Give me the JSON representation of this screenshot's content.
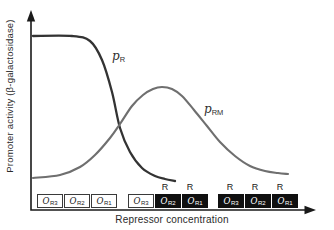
{
  "figure": {
    "y_axis_label": "Promoter activity (β-galactosidase)",
    "x_axis_label": "Repressor concentration"
  },
  "colors": {
    "axis": "#1a1a1a",
    "pr_curve": "#333333",
    "prm_curve": "#6f6f6f",
    "filled_box": "#101010",
    "filled_box_text": "#ffffff",
    "empty_box_border": "#3a3a3a",
    "text": "#2a2a2a"
  },
  "curve_labels": [
    {
      "id": "pr",
      "main": "p",
      "sub": "R",
      "x": 112,
      "y": 50
    },
    {
      "id": "prm",
      "main": "p",
      "sub": "RM",
      "x": 204,
      "y": 103
    }
  ],
  "curves": [
    {
      "name": "pR",
      "color": "#333333",
      "width": 2.3,
      "points": [
        [
          33,
          36
        ],
        [
          72,
          36
        ],
        [
          90,
          41
        ],
        [
          102,
          60
        ],
        [
          112,
          92
        ],
        [
          120,
          128
        ],
        [
          130,
          152
        ],
        [
          142,
          168
        ],
        [
          155,
          176
        ],
        [
          165,
          179
        ],
        [
          175,
          181
        ]
      ]
    },
    {
      "name": "pRM",
      "color": "#6f6f6f",
      "width": 2.1,
      "points": [
        [
          33,
          178
        ],
        [
          60,
          175
        ],
        [
          80,
          167
        ],
        [
          95,
          155
        ],
        [
          110,
          138
        ],
        [
          120,
          124
        ],
        [
          132,
          106
        ],
        [
          143,
          95
        ],
        [
          153,
          89
        ],
        [
          162,
          87
        ],
        [
          172,
          89
        ],
        [
          182,
          96
        ],
        [
          194,
          110
        ],
        [
          207,
          126
        ],
        [
          220,
          142
        ],
        [
          235,
          156
        ],
        [
          250,
          166
        ],
        [
          265,
          171
        ],
        [
          278,
          173
        ],
        [
          288,
          174
        ]
      ]
    }
  ],
  "repressor_label": "R",
  "operator_groups": [
    {
      "x": 37,
      "boxes": [
        {
          "main": "O",
          "sub": "R3",
          "filled": false,
          "repressor": false
        },
        {
          "main": "O",
          "sub": "R2",
          "filled": false,
          "repressor": false
        },
        {
          "main": "O",
          "sub": "R1",
          "filled": false,
          "repressor": false
        }
      ]
    },
    {
      "x": 128,
      "boxes": [
        {
          "main": "O",
          "sub": "R3",
          "filled": false,
          "repressor": false
        },
        {
          "main": "O",
          "sub": "R2",
          "filled": true,
          "repressor": true
        },
        {
          "main": "O",
          "sub": "R1",
          "filled": true,
          "repressor": true
        }
      ]
    },
    {
      "x": 218,
      "boxes": [
        {
          "main": "O",
          "sub": "R3",
          "filled": true,
          "repressor": true
        },
        {
          "main": "O",
          "sub": "R2",
          "filled": true,
          "repressor": true
        },
        {
          "main": "O",
          "sub": "R1",
          "filled": true,
          "repressor": true
        }
      ]
    }
  ],
  "chart_data": {
    "type": "line",
    "title": "",
    "xlabel": "Repressor concentration",
    "ylabel": "Promoter activity (β-galactosidase)",
    "xlim": [
      0,
      1
    ],
    "ylim": [
      0,
      1
    ],
    "grid": false,
    "legend_position": "inline-curve-labels",
    "axes_note": "Both axes are qualitative (no numeric ticks); values below are normalized 0-1 estimates read from the drawing.",
    "series": [
      {
        "name": "pR",
        "x": [
          0.01,
          0.15,
          0.21,
          0.26,
          0.29,
          0.32,
          0.36,
          0.4,
          0.45,
          0.48,
          0.52
        ],
        "values": [
          1.0,
          1.0,
          0.97,
          0.86,
          0.68,
          0.47,
          0.33,
          0.24,
          0.2,
          0.18,
          0.17
        ]
      },
      {
        "name": "pRM",
        "x": [
          0.01,
          0.18,
          0.29,
          0.32,
          0.4,
          0.47,
          0.55,
          0.64,
          0.74,
          0.84,
          0.93
        ],
        "values": [
          0.18,
          0.25,
          0.41,
          0.49,
          0.66,
          0.71,
          0.66,
          0.48,
          0.31,
          0.22,
          0.21
        ]
      }
    ],
    "annotations": [
      {
        "region": "low repressor concentration",
        "operators": "OR3, OR2, OR1 all unoccupied"
      },
      {
        "region": "mid repressor concentration",
        "operators": "OR2 and OR1 each bound by repressor (R); OR3 free"
      },
      {
        "region": "high repressor concentration",
        "operators": "OR3, OR2, OR1 all bound by repressor (R)"
      }
    ]
  }
}
